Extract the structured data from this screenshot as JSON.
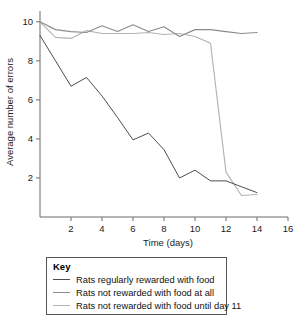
{
  "chart_data": {
    "type": "line",
    "title": "",
    "xlabel": "Time (days)",
    "ylabel": "Average number of errors",
    "xlim": [
      0,
      16
    ],
    "ylim": [
      0,
      10.4
    ],
    "xticks": [
      2,
      4,
      6,
      8,
      10,
      12,
      14,
      16
    ],
    "yticks": [
      2,
      4,
      6,
      8,
      10
    ],
    "grid": false,
    "legend_position": "below-plot",
    "legend_title": "Key",
    "series": [
      {
        "name": "Rats regularly rewarded with food",
        "color": "#4d4d4d",
        "x": [
          0,
          1,
          2,
          3,
          4,
          5,
          6,
          7,
          8,
          9,
          10,
          11,
          12,
          13,
          14
        ],
        "values": [
          9.3,
          8.0,
          6.7,
          7.15,
          6.2,
          5.1,
          3.95,
          4.3,
          3.45,
          2.0,
          2.4,
          1.85,
          1.85,
          1.55,
          1.25
        ]
      },
      {
        "name": "Rats not rewarded with food at all",
        "color": "#8c8c8c",
        "x": [
          0,
          1,
          2,
          3,
          4,
          5,
          6,
          7,
          8,
          9,
          10,
          11,
          12,
          13,
          14
        ],
        "values": [
          10.0,
          9.6,
          9.5,
          9.45,
          9.8,
          9.5,
          9.85,
          9.5,
          9.75,
          9.25,
          9.6,
          9.6,
          9.5,
          9.4,
          9.45
        ]
      },
      {
        "name": "Rats not rewarded with food until day 11",
        "color": "#b3b3b3",
        "x": [
          0,
          1,
          2,
          3,
          4,
          5,
          6,
          7,
          8,
          9,
          10,
          11,
          12,
          13,
          14
        ],
        "values": [
          10.0,
          9.2,
          9.15,
          9.55,
          9.4,
          9.4,
          9.4,
          9.45,
          9.35,
          9.4,
          9.25,
          8.9,
          2.3,
          1.1,
          1.15
        ]
      }
    ]
  }
}
